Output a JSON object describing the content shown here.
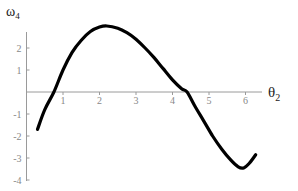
{
  "chart_data": {
    "type": "line",
    "title": "",
    "xlabel": "θ2",
    "ylabel": "ω4",
    "xlabel_main": "θ",
    "xlabel_sub": "2",
    "ylabel_main": "ω",
    "ylabel_sub": "4",
    "xlim": [
      0,
      6.6
    ],
    "ylim": [
      -4,
      3.2
    ],
    "x_ticks": [
      1,
      2,
      3,
      4,
      5,
      6
    ],
    "y_ticks": [
      -4,
      -3,
      -2,
      -1,
      1,
      2
    ],
    "grid": false,
    "legend": null,
    "series": [
      {
        "name": "ω4",
        "x": [
          0.3,
          0.5,
          0.75,
          1.0,
          1.25,
          1.5,
          1.75,
          2.0,
          2.2,
          2.5,
          2.75,
          3.0,
          3.25,
          3.5,
          3.75,
          4.0,
          4.25,
          4.4,
          4.6,
          4.85,
          5.1,
          5.35,
          5.6,
          5.8,
          5.95,
          6.1,
          6.28
        ],
        "values": [
          -1.7,
          -0.8,
          0.0,
          1.0,
          1.8,
          2.35,
          2.75,
          2.95,
          3.0,
          2.9,
          2.7,
          2.4,
          2.0,
          1.55,
          1.05,
          0.55,
          0.15,
          0.0,
          -0.6,
          -1.3,
          -2.0,
          -2.6,
          -3.1,
          -3.4,
          -3.45,
          -3.25,
          -2.85
        ],
        "color": "#000000"
      }
    ]
  }
}
